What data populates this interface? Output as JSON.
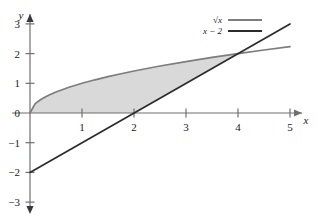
{
  "chart_data": {
    "type": "line",
    "title": "",
    "xlabel": "x",
    "ylabel": "y",
    "xlim": [
      -0.35,
      5.5
    ],
    "ylim": [
      -3.4,
      3.4
    ],
    "xticks": [
      "1",
      "2",
      "3",
      "4",
      "5"
    ],
    "xtick_values": [
      1,
      2,
      3,
      4,
      5
    ],
    "yticks": [
      "3",
      "2",
      "1",
      "0",
      "−1",
      "−2",
      "−3"
    ],
    "ytick_values": [
      3,
      2,
      1,
      0,
      -1,
      -2,
      -3
    ],
    "grid": false,
    "legend_position": "top-right",
    "series": [
      {
        "name": "√x",
        "type": "curve",
        "color": "#7d7d7d",
        "x": [
          0,
          0.1,
          0.2,
          0.3,
          0.4,
          0.5,
          0.75,
          1,
          1.25,
          1.5,
          1.75,
          2,
          2.5,
          3,
          3.5,
          4,
          4.5,
          5
        ],
        "values": [
          0,
          0.316,
          0.447,
          0.548,
          0.632,
          0.707,
          0.866,
          1,
          1.118,
          1.225,
          1.323,
          1.414,
          1.581,
          1.732,
          1.871,
          2,
          2.121,
          2.236
        ]
      },
      {
        "name": "x − 2",
        "type": "line",
        "color": "#2b2b2b",
        "x": [
          0,
          5
        ],
        "values": [
          -2,
          3
        ]
      }
    ],
    "intersections": [
      {
        "x": 4,
        "y": 2
      },
      {
        "x": 0,
        "y": 0
      }
    ],
    "shaded_region": {
      "label": "area between √x and x − 2",
      "color": "#d9d9d9",
      "x_from": 0,
      "x_to": 4,
      "upper": "√x",
      "lower_piecewise": [
        {
          "from": 0,
          "to": 2,
          "curve": "y = 0"
        },
        {
          "from": 2,
          "to": 4,
          "curve": "x − 2"
        }
      ]
    },
    "annotations": []
  },
  "legend": {
    "entries": [
      {
        "label": "√x",
        "color": "#7d7d7d"
      },
      {
        "label": "x − 2",
        "color": "#2b2b2b"
      }
    ]
  },
  "axes": {
    "x_name": "x",
    "y_name": "y"
  },
  "colors": {
    "sqrt_curve": "#7d7d7d",
    "line_curve": "#2b2b2b",
    "fill": "#d9d9d9",
    "axis": "#6f6f6f",
    "text": "#1a1a1a",
    "background": "#ffffff"
  }
}
